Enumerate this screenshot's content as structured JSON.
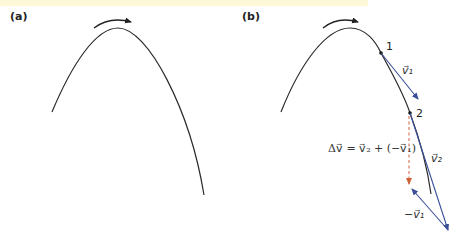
{
  "panels": [
    {
      "label": "(a)",
      "description": "projectile trajectory with direction-of-motion arrow"
    },
    {
      "label": "(b)",
      "description": "velocity vectors at two points along the trajectory",
      "points": [
        {
          "label": "1"
        },
        {
          "label": "2"
        }
      ],
      "vectors": {
        "v1": "v⃗₁",
        "v2": "v⃗₂",
        "neg_v1": "−v⃗₁"
      },
      "equation": "Δv⃗ = v⃗₂ + (−v⃗₁)"
    }
  ],
  "colors": {
    "trajectory": "#2a2a2a",
    "velocity_vector": "#3a4f9a",
    "delta_v": "#d0603a",
    "top_band": "#fdf8d8"
  }
}
